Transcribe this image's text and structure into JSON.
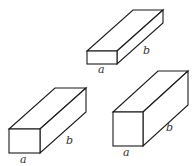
{
  "diagram": {
    "stroke_color": "#1a1a1a",
    "label_color": "#333333",
    "boxes": [
      {
        "id": "box-top",
        "front": {
          "x": 87,
          "y": 51,
          "w": 30,
          "h": 13
        },
        "depth": {
          "dx": 46,
          "dy": -41
        },
        "labels": {
          "a": "a",
          "b": "b"
        },
        "label_pos": {
          "a": [
            98,
            73
          ],
          "b": [
            143,
            54
          ]
        }
      },
      {
        "id": "box-bottom-left",
        "front": {
          "x": 9,
          "y": 129,
          "w": 31,
          "h": 24
        },
        "depth": {
          "dx": 46,
          "dy": -41
        },
        "labels": {
          "a": "a",
          "b": "b"
        },
        "label_pos": {
          "a": [
            20,
            163
          ],
          "b": [
            66,
            144
          ]
        }
      },
      {
        "id": "box-bottom-right",
        "front": {
          "x": 113,
          "y": 112,
          "w": 30,
          "h": 34
        },
        "depth": {
          "dx": 45,
          "dy": -41
        },
        "labels": {
          "a": "a",
          "b": "b"
        },
        "label_pos": {
          "a": [
            123,
            156
          ],
          "b": [
            166,
            131
          ]
        }
      }
    ]
  }
}
